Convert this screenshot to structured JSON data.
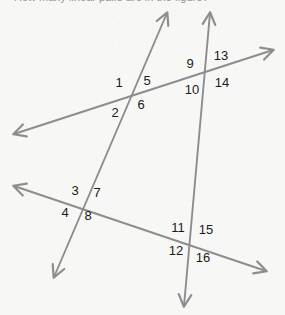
{
  "prompt": {
    "text": "How many linear pairs are in the figure?"
  },
  "figure": {
    "background_color": "#f7f7f6",
    "line_color": "#8d8d8d",
    "label_color": "#1a1a1a",
    "width": 285,
    "height": 315,
    "lines": [
      {
        "id": "line-a",
        "name": "upper-transversal",
        "start": [
          14,
          134
        ],
        "end": [
          273,
          50
        ],
        "arrow_start": true,
        "arrow_end": true
      },
      {
        "id": "line-b",
        "name": "left-steep-line",
        "start": [
          167,
          13
        ],
        "end": [
          54,
          277
        ],
        "arrow_start": true,
        "arrow_end": true
      },
      {
        "id": "line-c",
        "name": "right-vertical-line",
        "start": [
          210,
          13
        ],
        "end": [
          184,
          306
        ],
        "arrow_start": true,
        "arrow_end": true
      },
      {
        "id": "line-d",
        "name": "lower-transversal",
        "start": [
          14,
          186
        ],
        "end": [
          266,
          271
        ],
        "arrow_start": true,
        "arrow_end": true
      }
    ],
    "intersections": [
      {
        "id": "intersection-top-left",
        "point": [
          131,
          95
        ],
        "lines": [
          "line-a",
          "line-b"
        ]
      },
      {
        "id": "intersection-top-right",
        "point": [
          203,
          73
        ],
        "lines": [
          "line-a",
          "line-c"
        ]
      },
      {
        "id": "intersection-bottom-left",
        "point": [
          83,
          203
        ],
        "lines": [
          "line-b",
          "line-d"
        ]
      },
      {
        "id": "intersection-bottom-right",
        "point": [
          184,
          238
        ],
        "lines": [
          "line-c",
          "line-d"
        ]
      }
    ],
    "angle_labels": [
      {
        "id": "angle-1",
        "text": "1",
        "x": 119,
        "y": 82,
        "intersection": "intersection-top-left"
      },
      {
        "id": "angle-5",
        "text": "5",
        "x": 147,
        "y": 80,
        "intersection": "intersection-top-left"
      },
      {
        "id": "angle-2",
        "text": "2",
        "x": 115,
        "y": 112,
        "intersection": "intersection-top-left"
      },
      {
        "id": "angle-6",
        "text": "6",
        "x": 141,
        "y": 104,
        "intersection": "intersection-top-left"
      },
      {
        "id": "angle-9",
        "text": "9",
        "x": 190,
        "y": 63,
        "intersection": "intersection-top-right"
      },
      {
        "id": "angle-13",
        "text": "13",
        "x": 221,
        "y": 55,
        "intersection": "intersection-top-right"
      },
      {
        "id": "angle-10",
        "text": "10",
        "x": 192,
        "y": 89,
        "intersection": "intersection-top-right"
      },
      {
        "id": "angle-14",
        "text": "14",
        "x": 222,
        "y": 82,
        "intersection": "intersection-top-right"
      },
      {
        "id": "angle-3",
        "text": "3",
        "x": 75,
        "y": 190,
        "intersection": "intersection-bottom-left"
      },
      {
        "id": "angle-7",
        "text": "7",
        "x": 97,
        "y": 192,
        "intersection": "intersection-bottom-left"
      },
      {
        "id": "angle-4",
        "text": "4",
        "x": 65,
        "y": 212,
        "intersection": "intersection-bottom-left"
      },
      {
        "id": "angle-8",
        "text": "8",
        "x": 88,
        "y": 215,
        "intersection": "intersection-bottom-left"
      },
      {
        "id": "angle-11",
        "text": "11",
        "x": 178,
        "y": 227,
        "intersection": "intersection-bottom-right"
      },
      {
        "id": "angle-15",
        "text": "15",
        "x": 206,
        "y": 229,
        "intersection": "intersection-bottom-right"
      },
      {
        "id": "angle-12",
        "text": "12",
        "x": 176,
        "y": 250,
        "intersection": "intersection-bottom-right"
      },
      {
        "id": "angle-16",
        "text": "16",
        "x": 203,
        "y": 257,
        "intersection": "intersection-bottom-right"
      }
    ]
  }
}
